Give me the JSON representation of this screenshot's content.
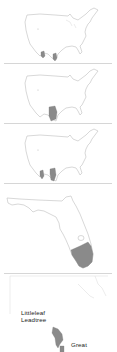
{
  "maps": [
    {
      "id": "map-1",
      "region": "United States",
      "range_description": "South Texas border region (two small patches)",
      "range_color": "#8a8a8a"
    },
    {
      "id": "map-2",
      "region": "United States",
      "range_description": "South Texas (single patch)",
      "range_color": "#8a8a8a"
    },
    {
      "id": "map-3",
      "region": "United States",
      "range_description": "South Texas border region (two patches)",
      "range_color": "#8a8a8a"
    },
    {
      "id": "map-4",
      "region": "Florida",
      "range_description": "Southern tip of Florida",
      "range_color": "#8a8a8a"
    },
    {
      "id": "map-5",
      "region": "Texas detail",
      "range_description": "South Texas detail",
      "range_color": "#8a8a8a"
    }
  ],
  "labels": {
    "species_line1": "Littleleaf",
    "species_line2": "Leadtree",
    "next_species": "Great"
  },
  "colors": {
    "outline": "#bdbdbd",
    "separator": "#d6d6d6",
    "range": "#8a8a8a",
    "text": "#222222"
  }
}
